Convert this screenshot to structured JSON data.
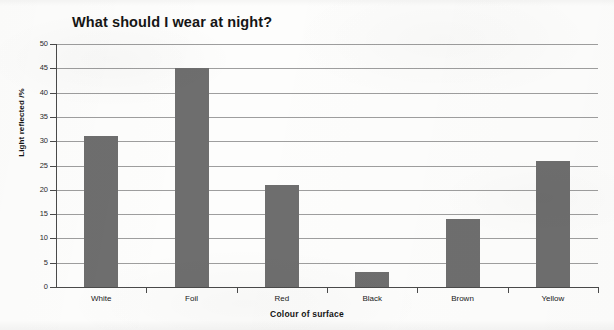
{
  "chart_data": {
    "type": "bar",
    "title": "What should I wear at night?",
    "xlabel": "Colour of surface",
    "ylabel": "Light reflected /%",
    "categories": [
      "White",
      "Foil",
      "Red",
      "Black",
      "Brown",
      "Yellow"
    ],
    "values": [
      31,
      45,
      21,
      3,
      14,
      26
    ],
    "ylim": [
      0,
      50
    ],
    "ytick_step": 5,
    "yticks": [
      0,
      5,
      10,
      15,
      20,
      25,
      30,
      35,
      40,
      45,
      50
    ],
    "ytick_labels": [
      "0",
      "5",
      "10",
      "15",
      "20",
      "25",
      "30",
      "35",
      "40",
      "45",
      "50"
    ],
    "grid": true,
    "grid_axis": "y",
    "legend": false,
    "bar_color": "#6e6e6e",
    "gridline_color": "#8d8d8d",
    "axis_color": "#4a4a4a",
    "background_color": "#fdfdfc",
    "series": [
      {
        "name": "Light reflected /%",
        "values": [
          31,
          45,
          21,
          3,
          14,
          26
        ]
      }
    ]
  }
}
